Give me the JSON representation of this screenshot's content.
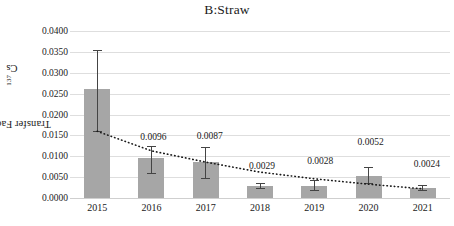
{
  "chart_data": {
    "type": "bar",
    "title": "B:Straw",
    "xlabel": "",
    "ylabel": "Transfer Factor of 137Cs",
    "ylabel_prefix": "Transfer Factor of ",
    "ylabel_superscript": "137",
    "ylabel_suffix": "Cs",
    "categories": [
      "2015",
      "2016",
      "2017",
      "2018",
      "2019",
      "2020",
      "2021"
    ],
    "values": [
      0.0262,
      0.0096,
      0.0087,
      0.0029,
      0.0028,
      0.0052,
      0.0024
    ],
    "data_labels": [
      "0.0262",
      "0.0096",
      "0.0087",
      "0.0029",
      "0.0028",
      "0.0052",
      "0.0024"
    ],
    "error_bars": {
      "lower": [
        0.016,
        0.0059,
        0.0049,
        0.0024,
        0.002,
        0.0036,
        0.002
      ],
      "upper": [
        0.0355,
        0.0125,
        0.0123,
        0.0036,
        0.0042,
        0.0075,
        0.0032
      ]
    },
    "trendline": {
      "style": "dotted",
      "color": "#1a1a1a",
      "values": [
        0.016,
        0.0113,
        0.0086,
        0.0062,
        0.0046,
        0.0033,
        0.0022
      ]
    },
    "ylim": [
      0.0,
      0.04
    ],
    "ytick_step": 0.005,
    "ytick_labels": [
      "0.0000",
      "0.0050",
      "0.0100",
      "0.0150",
      "0.0200",
      "0.0250",
      "0.0300",
      "0.0350",
      "0.0400"
    ],
    "ytick_values": [
      0.0,
      0.005,
      0.01,
      0.015,
      0.02,
      0.025,
      0.03,
      0.035,
      0.04
    ],
    "grid": true,
    "grid_axis": "y",
    "legend": false,
    "bar_color": "#a6a6a6",
    "error_color": "#444444",
    "grid_color": "#dedede"
  }
}
